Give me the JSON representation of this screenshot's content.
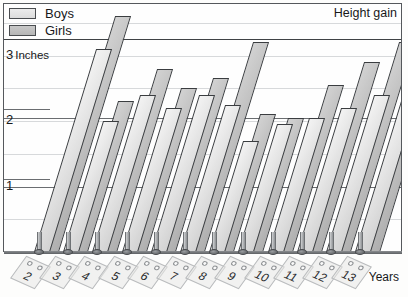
{
  "legend": {
    "items": [
      {
        "label": "Boys",
        "color": "#e4e4e4",
        "name": "legend-boys"
      },
      {
        "label": "Girls",
        "color": "#c2c2c2",
        "name": "legend-girls"
      }
    ]
  },
  "title": "Height gain",
  "yaxis": {
    "unit_label": "Inches",
    "ticks": [
      {
        "value": 3,
        "label": "3"
      },
      {
        "value": 2,
        "label": "2"
      },
      {
        "value": 1,
        "label": "1"
      }
    ]
  },
  "xaxis": {
    "title": "Years",
    "labels": [
      "2",
      "3",
      "4",
      "5",
      "6",
      "7",
      "8",
      "9",
      "10",
      "11",
      "12",
      "13"
    ]
  },
  "chart_data": {
    "type": "bar",
    "title": "Height gain",
    "xlabel": "Years",
    "ylabel": "Inches",
    "ylim": [
      0,
      3.75
    ],
    "grid": true,
    "legend_position": "top-left",
    "categories": [
      "2",
      "3",
      "4",
      "5",
      "6",
      "7",
      "8",
      "9",
      "10",
      "11",
      "12",
      "13"
    ],
    "series": [
      {
        "name": "Boys",
        "color": "#e4e4e4",
        "values": [
          3.1,
          2.0,
          2.4,
          2.2,
          2.4,
          2.25,
          1.7,
          1.95,
          2.05,
          2.2,
          2.4,
          2.5
        ]
      },
      {
        "name": "Girls",
        "color": "#c2c2c2",
        "values": [
          3.6,
          2.3,
          2.8,
          2.5,
          2.65,
          3.2,
          2.1,
          2.05,
          2.55,
          2.9,
          3.2,
          3.35
        ]
      }
    ]
  }
}
